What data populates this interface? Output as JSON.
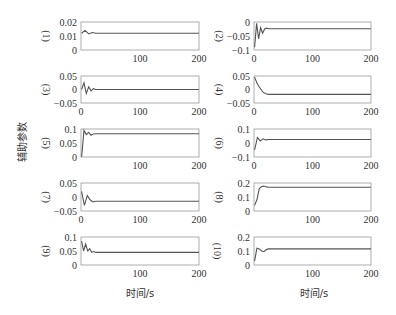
{
  "chart_data": {
    "type": "line",
    "ylabel": "辅助参数",
    "xlabel": "时间/s",
    "xlim": [
      0,
      200
    ],
    "xticks": [
      0,
      100,
      200
    ],
    "panels": [
      {
        "label": "(1)",
        "ylim": [
          0,
          0.02
        ],
        "yticks": [
          "0",
          "0.01",
          "0.02"
        ],
        "yticks_val": [
          0,
          0.01,
          0.02
        ],
        "steady": 0.012,
        "transient": [
          0.012,
          0.014,
          0.0115,
          0.0125,
          0.012
        ],
        "show_zero_x": false
      },
      {
        "label": "(2)",
        "ylim": [
          -0.1,
          0
        ],
        "yticks": [
          "-0.1",
          "-0.05",
          "0"
        ],
        "yticks_val": [
          -0.1,
          -0.05,
          0
        ],
        "steady": -0.024,
        "transient": [
          -0.09,
          -0.005,
          -0.06,
          -0.02,
          -0.04,
          -0.025,
          -0.022,
          -0.024
        ],
        "show_zero_x": true
      },
      {
        "label": "(3)",
        "ylim": [
          -0.05,
          0.05
        ],
        "yticks": [
          "-0.05",
          "0",
          "0.05"
        ],
        "yticks_val": [
          -0.05,
          0,
          0.05
        ],
        "steady": 0.0,
        "transient": [
          0.0,
          0.025,
          -0.015,
          0.01,
          -0.005,
          0.003,
          0.0
        ],
        "show_zero_x": true
      },
      {
        "label": "(4)",
        "ylim": [
          -0.05,
          0.05
        ],
        "yticks": [
          "-0.05",
          "0",
          "0.05"
        ],
        "yticks_val": [
          -0.05,
          0,
          0.05
        ],
        "steady": -0.018,
        "transient": [
          0.045,
          0.02,
          0.005,
          -0.01,
          -0.016,
          -0.018
        ],
        "show_zero_x": true
      },
      {
        "label": "(5)",
        "ylim": [
          0,
          0.1
        ],
        "yticks": [
          "0",
          "0.05",
          "0.1"
        ],
        "yticks_val": [
          0,
          0.05,
          0.1
        ],
        "steady": 0.083,
        "transient": [
          0.0,
          0.095,
          0.08,
          0.088,
          0.078,
          0.082,
          0.083
        ],
        "show_zero_x": false
      },
      {
        "label": "(6)",
        "ylim": [
          -0.1,
          0.1
        ],
        "yticks": [
          "-0.1",
          "0",
          "0.1"
        ],
        "yticks_val": [
          -0.1,
          0,
          0.1
        ],
        "steady": 0.025,
        "transient": [
          -0.05,
          0.04,
          0.015,
          0.03,
          0.022,
          0.025
        ],
        "show_zero_x": true
      },
      {
        "label": "(7)",
        "ylim": [
          -0.05,
          0.05
        ],
        "yticks": [
          "-0.05",
          "0",
          "0.05"
        ],
        "yticks_val": [
          -0.05,
          0,
          0.05
        ],
        "steady": -0.015,
        "transient": [
          0.02,
          -0.03,
          0.005,
          -0.01,
          -0.018,
          -0.015
        ],
        "show_zero_x": true
      },
      {
        "label": "(8)",
        "ylim": [
          0,
          0.2
        ],
        "yticks": [
          "0",
          "0.1",
          "0.2"
        ],
        "yticks_val": [
          0,
          0.1,
          0.2
        ],
        "steady": 0.17,
        "transient": [
          0.04,
          0.08,
          0.16,
          0.175,
          0.178,
          0.172,
          0.17
        ],
        "show_zero_x": false
      },
      {
        "label": "(9)",
        "ylim": [
          0,
          0.1
        ],
        "yticks": [
          "0",
          "0.05",
          "0.1"
        ],
        "yticks_val": [
          0,
          0.05,
          0.1
        ],
        "steady": 0.045,
        "transient": [
          0.085,
          0.05,
          0.075,
          0.05,
          0.058,
          0.045,
          0.048,
          0.045
        ],
        "show_zero_x": false
      },
      {
        "label": "(10)",
        "ylim": [
          0,
          0.2
        ],
        "yticks": [
          "0",
          "0.1",
          "0.2"
        ],
        "yticks_val": [
          0,
          0.1,
          0.2
        ],
        "steady": 0.115,
        "transient": [
          0.03,
          0.12,
          0.115,
          0.1,
          0.095,
          0.11,
          0.115
        ],
        "show_zero_x": false
      }
    ]
  }
}
